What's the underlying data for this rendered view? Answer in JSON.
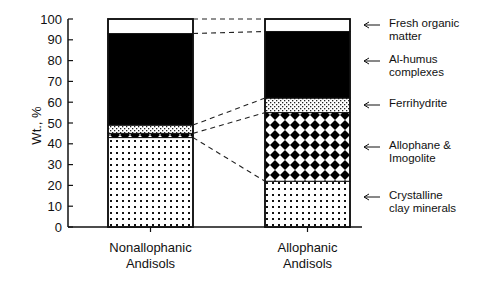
{
  "chart_data": {
    "type": "bar",
    "stacked": true,
    "title": "",
    "xlabel": "",
    "ylabel": "Wt., %",
    "ylim": [
      0,
      100
    ],
    "yticks": [
      0,
      10,
      20,
      30,
      40,
      50,
      60,
      70,
      80,
      90,
      100
    ],
    "grid": false,
    "categories": [
      "Nonallophanic Andisols",
      "Allophanic Andisols"
    ],
    "category_lines": [
      [
        "Nonallophanic",
        "Andisols"
      ],
      [
        "Allophanic",
        "Andisols"
      ]
    ],
    "series": [
      {
        "name": "Crystalline clay minerals",
        "values": [
          43,
          22
        ],
        "pattern": "dots"
      },
      {
        "name": "Allophane & Imogolite",
        "values": [
          2,
          33
        ],
        "pattern": "diamonds"
      },
      {
        "name": "Ferrihydrite",
        "values": [
          4,
          7
        ],
        "pattern": "stipple"
      },
      {
        "name": "Al-humus complexes",
        "values": [
          44,
          32
        ],
        "pattern": "solid-black"
      },
      {
        "name": "Fresh organic matter",
        "values": [
          7,
          6
        ],
        "pattern": "white"
      }
    ],
    "legend_position": "right",
    "legend": [
      {
        "lines": [
          "Fresh organic",
          "matter"
        ]
      },
      {
        "lines": [
          "Al-humus",
          "complexes"
        ]
      },
      {
        "lines": [
          "Ferrihydrite"
        ]
      },
      {
        "lines": [
          "Allophane &",
          "Imogolite"
        ]
      },
      {
        "lines": [
          "Crystalline",
          "clay minerals"
        ]
      }
    ]
  },
  "axis": {
    "ylabel": "Wt., %"
  },
  "arrow_glyph": "←"
}
